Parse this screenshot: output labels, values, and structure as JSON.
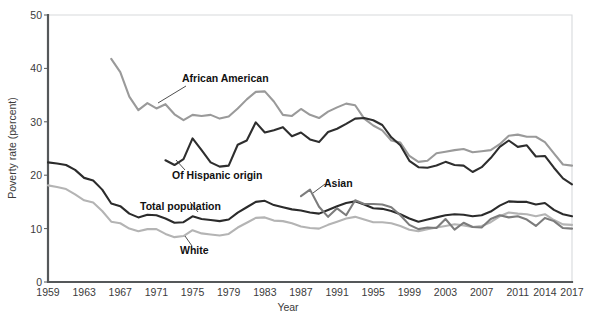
{
  "chart_data": {
    "type": "line",
    "title": "",
    "xlabel": "Year",
    "ylabel": "Poverty rate (percent)",
    "xlim": [
      1959,
      2017
    ],
    "ylim": [
      0,
      50
    ],
    "grid": false,
    "legend_position": "inline-annotations",
    "xticks": [
      "1959",
      "1963",
      "1967",
      "1971",
      "1975",
      "1979",
      "1983",
      "1987",
      "1991",
      "1995",
      "1999",
      "2003",
      "2007",
      "2011",
      "2014",
      "2017"
    ],
    "xtick_values": [
      1959,
      1963,
      1967,
      1971,
      1975,
      1979,
      1983,
      1987,
      1991,
      1995,
      1999,
      2003,
      2007,
      2011,
      2014,
      2017
    ],
    "yticks": [
      "0",
      "10",
      "20",
      "30",
      "40",
      "50"
    ],
    "ytick_values": [
      0,
      10,
      20,
      30,
      40,
      50
    ],
    "colors": {
      "african_american": "#9a9a9a",
      "hispanic": "#2e2e2e",
      "total_population": "#2b2b2b",
      "white": "#b4b4b4",
      "asian": "#7c7c7c",
      "axis": "#55585a",
      "background": "#ffffff",
      "text": "#231f20"
    },
    "series": [
      {
        "name": "African American",
        "color": "#9a9a9a",
        "label_x": 1977,
        "label_y": 43.0,
        "x": [
          1966,
          1967,
          1968,
          1969,
          1970,
          1971,
          1972,
          1973,
          1974,
          1975,
          1976,
          1977,
          1978,
          1979,
          1980,
          1981,
          1982,
          1983,
          1984,
          1985,
          1986,
          1987,
          1988,
          1989,
          1990,
          1991,
          1992,
          1993,
          1994,
          1995,
          1996,
          1997,
          1998,
          1999,
          2000,
          2001,
          2002,
          2003,
          2004,
          2005,
          2006,
          2007,
          2008,
          2009,
          2010,
          2011,
          2012,
          2013,
          2014,
          2015,
          2016,
          2017
        ],
        "values": [
          41.8,
          39.3,
          34.7,
          32.2,
          33.5,
          32.5,
          33.3,
          31.4,
          30.3,
          31.3,
          31.1,
          31.3,
          30.6,
          31.0,
          32.5,
          34.2,
          35.6,
          35.7,
          33.8,
          31.3,
          31.1,
          32.4,
          31.3,
          30.7,
          31.9,
          32.7,
          33.4,
          33.1,
          30.6,
          29.3,
          28.4,
          26.5,
          26.1,
          23.6,
          22.5,
          22.7,
          24.1,
          24.4,
          24.7,
          24.9,
          24.3,
          24.5,
          24.7,
          25.8,
          27.4,
          27.6,
          27.2,
          27.2,
          26.2,
          24.1,
          22.0,
          21.8
        ]
      },
      {
        "name": "Of Hispanic origin",
        "color": "#2e2e2e",
        "label_x": 1977,
        "label_y": 17.7,
        "x": [
          1972,
          1973,
          1974,
          1975,
          1976,
          1977,
          1978,
          1979,
          1980,
          1981,
          1982,
          1983,
          1984,
          1985,
          1986,
          1987,
          1988,
          1989,
          1990,
          1991,
          1992,
          1993,
          1994,
          1995,
          1996,
          1997,
          1998,
          1999,
          2000,
          2001,
          2002,
          2003,
          2004,
          2005,
          2006,
          2007,
          2008,
          2009,
          2010,
          2011,
          2012,
          2013,
          2014,
          2015,
          2016,
          2017
        ],
        "values": [
          22.8,
          21.9,
          23.0,
          26.9,
          24.7,
          22.4,
          21.6,
          21.8,
          25.7,
          26.5,
          29.9,
          28.0,
          28.4,
          29.0,
          27.3,
          28.0,
          26.7,
          26.2,
          28.1,
          28.7,
          29.6,
          30.6,
          30.7,
          30.3,
          29.4,
          27.1,
          25.6,
          22.7,
          21.5,
          21.4,
          21.8,
          22.5,
          21.9,
          21.8,
          20.6,
          21.5,
          23.2,
          25.3,
          26.5,
          25.3,
          25.6,
          23.5,
          23.6,
          21.4,
          19.4,
          18.3
        ]
      },
      {
        "name": "Total population",
        "color": "#2b2b2b",
        "label_x": 1976,
        "label_y": 14.1,
        "x": [
          1959,
          1960,
          1961,
          1962,
          1963,
          1964,
          1965,
          1966,
          1967,
          1968,
          1969,
          1970,
          1971,
          1972,
          1973,
          1974,
          1975,
          1976,
          1977,
          1978,
          1979,
          1980,
          1981,
          1982,
          1983,
          1984,
          1985,
          1986,
          1987,
          1988,
          1989,
          1990,
          1991,
          1992,
          1993,
          1994,
          1995,
          1996,
          1997,
          1998,
          1999,
          2000,
          2001,
          2002,
          2003,
          2004,
          2005,
          2006,
          2007,
          2008,
          2009,
          2010,
          2011,
          2012,
          2013,
          2014,
          2015,
          2016,
          2017
        ],
        "values": [
          22.4,
          22.2,
          21.9,
          21.0,
          19.5,
          19.0,
          17.3,
          14.7,
          14.2,
          12.8,
          12.1,
          12.6,
          12.5,
          11.9,
          11.1,
          11.2,
          12.3,
          11.8,
          11.6,
          11.4,
          11.7,
          13.0,
          14.0,
          15.0,
          15.2,
          14.4,
          14.0,
          13.6,
          13.4,
          13.0,
          12.8,
          13.5,
          14.2,
          14.8,
          15.1,
          14.5,
          13.8,
          13.7,
          13.3,
          12.7,
          11.9,
          11.3,
          11.7,
          12.1,
          12.5,
          12.7,
          12.6,
          12.3,
          12.5,
          13.2,
          14.3,
          15.1,
          15.0,
          15.0,
          14.5,
          14.8,
          13.5,
          12.7,
          12.3
        ]
      },
      {
        "name": "White",
        "color": "#b4b4b4",
        "label_x": 1977,
        "label_y": 7.6,
        "x": [
          1959,
          1960,
          1961,
          1962,
          1963,
          1964,
          1965,
          1966,
          1967,
          1968,
          1969,
          1970,
          1971,
          1972,
          1973,
          1974,
          1975,
          1976,
          1977,
          1978,
          1979,
          1980,
          1981,
          1982,
          1983,
          1984,
          1985,
          1986,
          1987,
          1988,
          1989,
          1990,
          1991,
          1992,
          1993,
          1994,
          1995,
          1996,
          1997,
          1998,
          1999,
          2000,
          2001,
          2002,
          2003,
          2004,
          2005,
          2006,
          2007,
          2008,
          2009,
          2010,
          2011,
          2012,
          2013,
          2014,
          2015,
          2016,
          2017
        ],
        "values": [
          18.1,
          17.8,
          17.4,
          16.4,
          15.3,
          14.9,
          13.3,
          11.3,
          11.0,
          10.0,
          9.5,
          9.9,
          9.9,
          9.0,
          8.4,
          8.6,
          9.7,
          9.1,
          8.9,
          8.7,
          9.0,
          10.2,
          11.1,
          12.0,
          12.1,
          11.5,
          11.4,
          11.0,
          10.4,
          10.1,
          10.0,
          10.7,
          11.3,
          11.9,
          12.2,
          11.7,
          11.2,
          11.2,
          11.0,
          10.5,
          9.8,
          9.5,
          9.9,
          10.2,
          10.5,
          10.8,
          10.6,
          10.3,
          10.5,
          11.2,
          12.3,
          13.0,
          12.8,
          12.7,
          12.3,
          12.7,
          11.6,
          10.8,
          10.7
        ]
      },
      {
        "name": "Asian",
        "color": "#7c7c7c",
        "label_x": 1991,
        "label_y": 17.6,
        "x": [
          1987,
          1988,
          1989,
          1990,
          1991,
          1992,
          1993,
          1994,
          1995,
          1996,
          1997,
          1998,
          1999,
          2000,
          2001,
          2002,
          2003,
          2004,
          2005,
          2006,
          2007,
          2008,
          2009,
          2010,
          2011,
          2012,
          2013,
          2014,
          2015,
          2016,
          2017
        ],
        "values": [
          16.1,
          17.3,
          14.1,
          12.2,
          13.8,
          12.5,
          15.3,
          14.6,
          14.6,
          14.5,
          14.0,
          12.5,
          10.7,
          9.9,
          10.2,
          10.1,
          11.8,
          9.8,
          11.1,
          10.3,
          10.2,
          11.8,
          12.5,
          12.1,
          12.3,
          11.7,
          10.5,
          12.0,
          11.4,
          10.1,
          10.0
        ]
      }
    ]
  },
  "axis": {
    "y_title": "Poverty rate (percent)",
    "x_title": "Year"
  },
  "labels": {
    "african_american": "African American",
    "hispanic": "Of Hispanic origin",
    "total_population": "Total population",
    "white": "White",
    "asian": "Asian"
  }
}
